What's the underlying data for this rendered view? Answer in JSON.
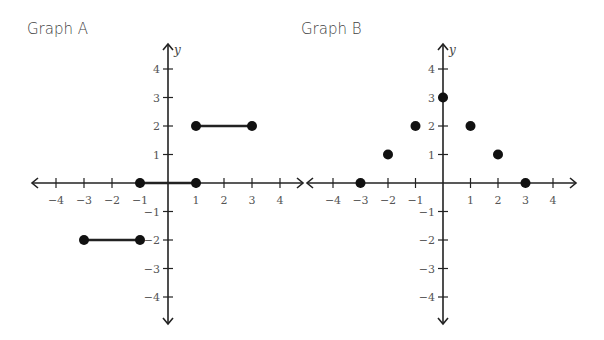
{
  "graphs": [
    {
      "title": "Graph A"
    },
    {
      "title": "Graph B"
    }
  ],
  "chart_data": [
    {
      "type": "line",
      "title": "Graph A",
      "xlabel": "x",
      "ylabel": "y",
      "xlim": [
        -4,
        4
      ],
      "ylim": [
        -4,
        4
      ],
      "x_ticks": [
        -4,
        -3,
        -2,
        -1,
        1,
        2,
        3,
        4
      ],
      "y_ticks": [
        -4,
        -3,
        -2,
        -1,
        1,
        2,
        3,
        4
      ],
      "grid": false,
      "series": [
        {
          "name": "segment-1",
          "x": [
            -3,
            -1
          ],
          "y": [
            -2,
            -2
          ],
          "endpoints": "closed"
        },
        {
          "name": "segment-2",
          "x": [
            -1,
            1
          ],
          "y": [
            0,
            0
          ],
          "endpoints": "closed"
        },
        {
          "name": "segment-3",
          "x": [
            1,
            3
          ],
          "y": [
            2,
            2
          ],
          "endpoints": "closed"
        }
      ]
    },
    {
      "type": "scatter",
      "title": "Graph B",
      "xlabel": "x",
      "ylabel": "y",
      "xlim": [
        -4,
        4
      ],
      "ylim": [
        -4,
        4
      ],
      "x_ticks": [
        -4,
        -3,
        -2,
        -1,
        1,
        2,
        3,
        4
      ],
      "y_ticks": [
        -4,
        -3,
        -2,
        -1,
        1,
        2,
        3,
        4
      ],
      "grid": false,
      "series": [
        {
          "name": "points",
          "x": [
            -3,
            -2,
            -1,
            0,
            1,
            2,
            3
          ],
          "y": [
            0,
            1,
            2,
            3,
            2,
            1,
            0
          ]
        }
      ]
    }
  ]
}
